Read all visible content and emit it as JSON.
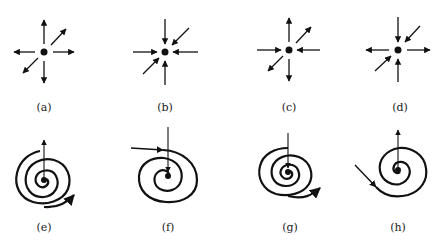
{
  "figure": {
    "ink_color": "#111111",
    "panels": [
      {
        "id": "a",
        "label": "(a)",
        "type": "node",
        "description": "all arrows point outward from the dot",
        "arrows": [
          "out-up",
          "out-upright",
          "out-right",
          "out-down",
          "out-downleft",
          "out-left"
        ]
      },
      {
        "id": "b",
        "label": "(b)",
        "type": "node",
        "description": "all arrows point inward toward the dot",
        "arrows": [
          "in-up",
          "in-upright",
          "in-right",
          "in-down",
          "in-downleft",
          "in-left"
        ]
      },
      {
        "id": "c",
        "label": "(c)",
        "type": "mixed",
        "description": "up, upper-right, down, lower-left outward; left and right inward",
        "arrows": [
          "out-up",
          "out-upright",
          "in-right",
          "out-down",
          "out-downleft",
          "in-left"
        ]
      },
      {
        "id": "d",
        "label": "(d)",
        "type": "mixed",
        "description": "up, upper-right, down, lower-left inward; left and right outward",
        "arrows": [
          "in-up",
          "in-upright",
          "out-right",
          "in-down",
          "in-downleft",
          "out-left"
        ]
      },
      {
        "id": "e",
        "label": "(e)",
        "type": "spiral",
        "description": "spiral outward ending in arrow to lower right; vertical arrow pointing up out of center"
      },
      {
        "id": "f",
        "label": "(f)",
        "type": "spiral",
        "description": "arrow enters spiral from left; vertical arrow pointing down into center"
      },
      {
        "id": "g",
        "label": "(g)",
        "type": "spiral",
        "description": "spiral outward ending in arrow to right; vertical arrow pointing down into center"
      },
      {
        "id": "h",
        "label": "(h)",
        "type": "spiral",
        "description": "arrow enters spiral from upper left; vertical arrow pointing up out of center"
      }
    ]
  }
}
